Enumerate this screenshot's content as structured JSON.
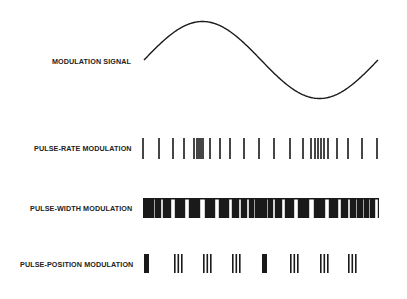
{
  "labels": {
    "modulation_signal": "MODULATION SIGNAL",
    "pulse_rate": "PULSE-RATE MODULATION",
    "pulse_width": "PULSE-WIDTH MODULATION",
    "pulse_position": "PULSE-POSITION MODULATION"
  },
  "colors": {
    "ink": "#1a1a1a",
    "background": "#ffffff"
  },
  "signal": {
    "start": [
      144,
      60
    ],
    "peak": [
      202,
      22
    ],
    "zero_cross": [
      262,
      60
    ],
    "trough": [
      318,
      99
    ],
    "end": [
      378,
      60
    ]
  },
  "pulse_rate": {
    "y_top": 138,
    "y_bottom": 159,
    "x": [
      143,
      159,
      173,
      184,
      194,
      197,
      199,
      201,
      203,
      210,
      220,
      230,
      244,
      259,
      274,
      290,
      303,
      311,
      315,
      318,
      321,
      324,
      328,
      337,
      348,
      362,
      377
    ]
  },
  "pulse_width": {
    "y_top": 198,
    "y_bottom": 218,
    "gaps": [
      [
        145,
        147
      ],
      [
        148,
        150
      ],
      [
        151,
        153
      ],
      [
        156,
        160
      ],
      [
        164,
        170
      ],
      [
        176,
        184
      ],
      [
        190,
        199
      ],
      [
        206,
        214
      ],
      [
        220,
        228
      ],
      [
        233,
        238
      ],
      [
        242,
        246
      ],
      [
        250,
        253
      ],
      [
        256,
        258
      ],
      [
        260,
        262
      ],
      [
        264,
        266
      ],
      [
        269,
        272
      ],
      [
        276,
        281
      ],
      [
        286,
        293
      ],
      [
        299,
        308
      ],
      [
        315,
        324
      ],
      [
        330,
        337
      ],
      [
        342,
        347
      ],
      [
        351,
        355
      ],
      [
        358,
        362
      ],
      [
        365,
        368
      ],
      [
        371,
        374
      ]
    ],
    "x_start": 143,
    "x_end": 379
  },
  "pulse_position": {
    "y_top": 254,
    "y_bottom": 273,
    "blocks": [
      [
        144,
        5
      ]
    ],
    "groups": [
      {
        "type": "block",
        "x": 144,
        "w": 5
      },
      {
        "type": "triple",
        "x": 174
      },
      {
        "type": "triple",
        "x": 203
      },
      {
        "type": "triple",
        "x": 232
      },
      {
        "type": "block",
        "x": 262,
        "w": 5
      },
      {
        "type": "triple",
        "x": 290
      },
      {
        "type": "triple",
        "x": 320
      },
      {
        "type": "triple",
        "x": 348
      }
    ]
  }
}
